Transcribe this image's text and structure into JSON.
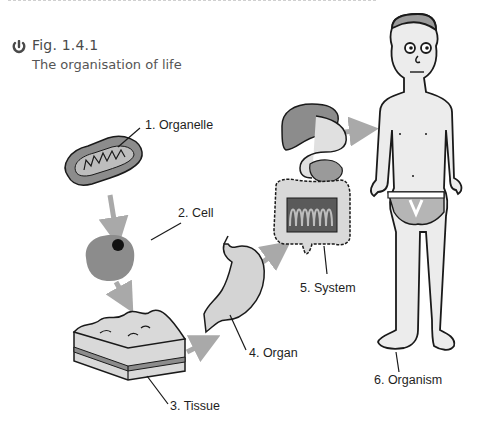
{
  "figure": {
    "number": "Fig. 1.4.1",
    "caption": "The organisation of life",
    "icon": "figure-marker-icon"
  },
  "levels": [
    {
      "label": "1. Organelle",
      "illustration": "mitochondrion"
    },
    {
      "label": "2. Cell",
      "illustration": "cell"
    },
    {
      "label": "3. Tissue",
      "illustration": "tissue-block"
    },
    {
      "label": "4. Organ",
      "illustration": "stomach"
    },
    {
      "label": "5. System",
      "illustration": "digestive-system"
    },
    {
      "label": "6. Organism",
      "illustration": "human"
    }
  ],
  "colors": {
    "arrow": "#a9a9a9",
    "outline": "#1a1a1a",
    "mid_grey": "#8c8c8c",
    "light_grey": "#d9d9d9",
    "skin": "#ececec",
    "text": "#1e1e1e",
    "caption": "#555555"
  }
}
